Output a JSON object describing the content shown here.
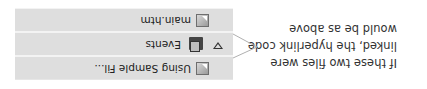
{
  "tree": {
    "items": [
      {
        "label": "Using Sample Fil...",
        "icon": "file-link-icon"
      },
      {
        "label": "Events",
        "icon": "folder-icon",
        "expanded": true
      },
      {
        "label": "main.htm",
        "icon": "file-link-icon"
      }
    ]
  },
  "annotation": {
    "text": "If these two files were linked, the hyperlink code would be as above"
  },
  "colors": {
    "row_bg": "#dedede",
    "callout_line": "#b0b0b0",
    "text": "#333333"
  }
}
